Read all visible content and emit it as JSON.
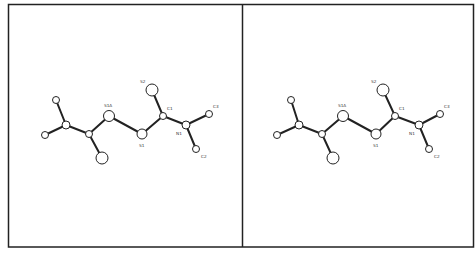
{
  "figure": {
    "type": "stereo-pair molecular structure (ball-and-stick)",
    "frame": {
      "x": 8.5,
      "y": 4.5,
      "width": 465,
      "height": 242.5,
      "divider_x": 242.5
    },
    "colors": {
      "stroke": "#222222",
      "atom_fill": "#ffffff",
      "background": "#ffffff"
    },
    "panels": [
      {
        "name": "left-view",
        "atoms": [
          {
            "id": "a1",
            "label": "",
            "x": 56,
            "y": 100,
            "r": 3.5
          },
          {
            "id": "a2",
            "label": "",
            "x": 45,
            "y": 135,
            "r": 3.5
          },
          {
            "id": "a3",
            "label": "",
            "x": 66,
            "y": 125,
            "r": 4
          },
          {
            "id": "a4",
            "label": "",
            "x": 89,
            "y": 134,
            "r": 3.5
          },
          {
            "id": "a5",
            "label": "",
            "x": 102,
            "y": 158,
            "r": 6
          },
          {
            "id": "S1A",
            "label": "S1A",
            "x": 109,
            "y": 116,
            "r": 5.5,
            "lx": 104,
            "ly": 107
          },
          {
            "id": "S1",
            "label": "S1",
            "x": 142,
            "y": 134,
            "r": 5,
            "lx": 139,
            "ly": 147
          },
          {
            "id": "S2",
            "label": "S2",
            "x": 152,
            "y": 90,
            "r": 6,
            "lx": 140,
            "ly": 83
          },
          {
            "id": "C1",
            "label": "C1",
            "x": 163,
            "y": 116,
            "r": 3.5,
            "lx": 167,
            "ly": 110
          },
          {
            "id": "N1",
            "label": "N1",
            "x": 186,
            "y": 125,
            "r": 4,
            "lx": 176,
            "ly": 135
          },
          {
            "id": "C3",
            "label": "C3",
            "x": 209,
            "y": 114,
            "r": 3.5,
            "lx": 213,
            "ly": 108
          },
          {
            "id": "C2",
            "label": "C2",
            "x": 196,
            "y": 149,
            "r": 3.5,
            "lx": 201,
            "ly": 158
          }
        ]
      },
      {
        "name": "right-view",
        "atoms": [
          {
            "id": "a1",
            "label": "",
            "x": 291,
            "y": 100,
            "r": 3.5
          },
          {
            "id": "a2",
            "label": "",
            "x": 277,
            "y": 135,
            "r": 3.5
          },
          {
            "id": "a3",
            "label": "",
            "x": 299,
            "y": 125,
            "r": 4
          },
          {
            "id": "a4",
            "label": "",
            "x": 322,
            "y": 134,
            "r": 3.5
          },
          {
            "id": "a5",
            "label": "",
            "x": 333,
            "y": 158,
            "r": 6
          },
          {
            "id": "S1A",
            "label": "S1A",
            "x": 343,
            "y": 116,
            "r": 5.5,
            "lx": 338,
            "ly": 107
          },
          {
            "id": "S1",
            "label": "S1",
            "x": 376,
            "y": 134,
            "r": 5,
            "lx": 373,
            "ly": 147
          },
          {
            "id": "S2",
            "label": "S2",
            "x": 383,
            "y": 90,
            "r": 6,
            "lx": 371,
            "ly": 83
          },
          {
            "id": "C1",
            "label": "C1",
            "x": 395,
            "y": 116,
            "r": 3.5,
            "lx": 399,
            "ly": 110
          },
          {
            "id": "N1",
            "label": "N1",
            "x": 419,
            "y": 125,
            "r": 4,
            "lx": 409,
            "ly": 135
          },
          {
            "id": "C3",
            "label": "C3",
            "x": 440,
            "y": 114,
            "r": 3.5,
            "lx": 444,
            "ly": 108
          },
          {
            "id": "C2",
            "label": "C2",
            "x": 429,
            "y": 149,
            "r": 3.5,
            "lx": 434,
            "ly": 158
          }
        ]
      }
    ],
    "bonds": [
      [
        "a1",
        "a3"
      ],
      [
        "a2",
        "a3"
      ],
      [
        "a3",
        "a4"
      ],
      [
        "a4",
        "a5"
      ],
      [
        "a4",
        "S1A"
      ],
      [
        "S1A",
        "S1"
      ],
      [
        "S1",
        "C1"
      ],
      [
        "C1",
        "S2"
      ],
      [
        "C1",
        "N1"
      ],
      [
        "N1",
        "C3"
      ],
      [
        "N1",
        "C2"
      ]
    ]
  }
}
